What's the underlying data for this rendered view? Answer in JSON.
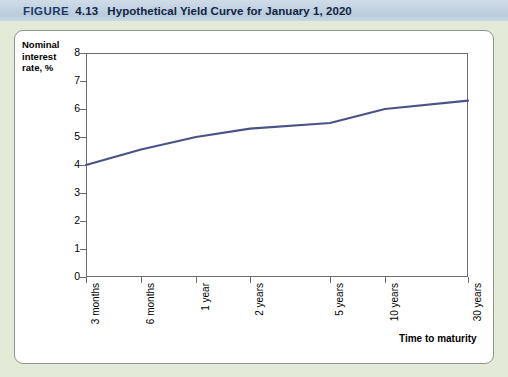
{
  "figure": {
    "label": "FIGURE",
    "number": "4.13",
    "title": "Hypothetical Yield Curve for January 1, 2020"
  },
  "chart_data": {
    "type": "line",
    "title": "Hypothetical Yield Curve for January 1, 2020",
    "xlabel": "Time to maturity",
    "ylabel": "Nominal interest rate, %",
    "categories": [
      "3 months",
      "6 months",
      "1 year",
      "2 years",
      "5 years",
      "10 years",
      "30 years"
    ],
    "values": [
      4.0,
      4.55,
      5.0,
      5.3,
      5.5,
      6.0,
      6.3
    ],
    "ylim": [
      0,
      8
    ],
    "yticks": [
      "0",
      "1",
      "2",
      "3",
      "4",
      "5",
      "6",
      "7",
      "8"
    ],
    "grid": false,
    "legend": "none",
    "series_color": "#4a5288"
  },
  "colors": {
    "page_background": "#e4ead8",
    "title_bar": "#c2d2e2",
    "title_text": "#11243f",
    "panel": "#ffffff",
    "axis": "#6e6e6e",
    "curve": "#4a5288"
  }
}
